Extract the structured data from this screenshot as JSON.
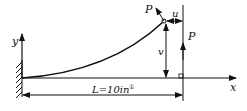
{
  "diagram": {
    "labels": {
      "y_axis": "y",
      "x_axis": "x",
      "force_tip": "P",
      "force_vertical": "P",
      "horizontal_displacement": "u",
      "vertical_displacement": "v",
      "length": "L=10in",
      "length_note": "①"
    },
    "colors": {
      "stroke": "#111111",
      "background": "#ffffff"
    }
  }
}
